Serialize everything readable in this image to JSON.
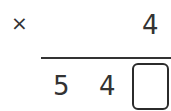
{
  "problem": {
    "operator": "×",
    "multiplier_digit": "4",
    "result_digits": [
      "5",
      "4"
    ],
    "answer_box": {
      "value": "",
      "placeholder": ""
    }
  },
  "colors": {
    "ink": "#333333",
    "box_border": "#2b2b2b",
    "background": "#ffffff"
  }
}
